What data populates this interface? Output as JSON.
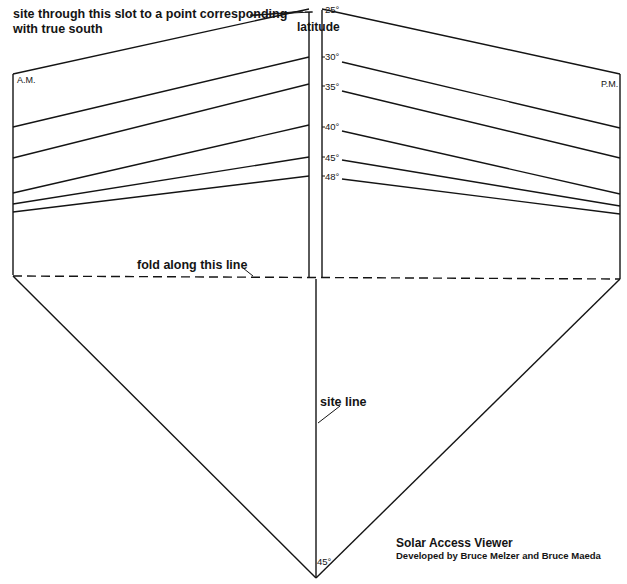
{
  "labels": {
    "callout_line1": "site through this slot to a point corresponding",
    "callout_line2": "with true south",
    "latitude_title": "latitude",
    "am": "A.M.",
    "pm": "P.M.",
    "fold": "fold along this line",
    "site_line": "site line",
    "bottom_angle": "45°"
  },
  "latitudes": [
    {
      "label": "25°"
    },
    {
      "label": "30°"
    },
    {
      "label": "35°"
    },
    {
      "label": "40°"
    },
    {
      "label": "45°"
    },
    {
      "label": "48°"
    }
  ],
  "credits": {
    "title": "Solar Access Viewer",
    "subtitle": "Developed by Bruce Melzer and Bruce Maeda"
  }
}
